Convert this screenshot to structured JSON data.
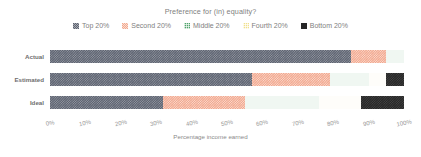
{
  "chart_data": {
    "type": "bar",
    "orientation": "horizontal",
    "stacked": true,
    "normalized": true,
    "title": "Preference for (in) equality?",
    "xlabel": "Percentage income earned",
    "ylabel": "",
    "xlim": [
      0,
      100
    ],
    "grid": false,
    "legend_position": "top",
    "categories": [
      "Actual",
      "Estimated",
      "Ideal"
    ],
    "xticks": [
      "0%",
      "10%",
      "20%",
      "30%",
      "40%",
      "50%",
      "60%",
      "70%",
      "80%",
      "90%",
      "100%"
    ],
    "xtick_values": [
      0,
      10,
      20,
      30,
      40,
      50,
      60,
      70,
      80,
      90,
      100
    ],
    "series": [
      {
        "name": "Top 20%",
        "color": "#5c6270",
        "values": [
          85,
          57,
          32
        ]
      },
      {
        "name": "Second 20%",
        "color": "#f2a78d",
        "values": [
          10,
          22,
          23
        ]
      },
      {
        "name": "Middle 20%",
        "color": "#4fa36b",
        "values": [
          5,
          11,
          21
        ]
      },
      {
        "name": "Fourth 20%",
        "color": "#f0e08c",
        "values": [
          0,
          5,
          12
        ]
      },
      {
        "name": "Bottom 20%",
        "color": "#262626",
        "values": [
          0,
          5,
          12
        ]
      }
    ]
  },
  "legend": {
    "items": [
      {
        "label": "Top 20%",
        "swatch": "sw-top"
      },
      {
        "label": "Second 20%",
        "swatch": "sw-second"
      },
      {
        "label": "Middle 20%",
        "swatch": "sw-middle"
      },
      {
        "label": "Fourth 20%",
        "swatch": "sw-fourth"
      },
      {
        "label": "Bottom 20%",
        "swatch": "sw-bottom"
      }
    ]
  }
}
